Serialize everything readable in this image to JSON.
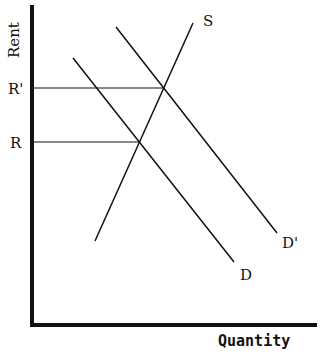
{
  "diagram": {
    "type": "supply-demand",
    "title": "",
    "axes": {
      "y_label": "Rent",
      "x_label": "Quantity"
    },
    "price_levels": [
      {
        "label": "R'",
        "y": 88
      },
      {
        "label": "R",
        "y": 142
      }
    ],
    "curves": [
      {
        "name": "S",
        "label": "S",
        "x1": 95,
        "y1": 241,
        "x2": 193,
        "y2": 23
      },
      {
        "name": "D",
        "label": "D",
        "x1": 73,
        "y1": 58,
        "x2": 234,
        "y2": 262
      },
      {
        "name": "D-prime",
        "label": "D'",
        "x1": 116,
        "y1": 27,
        "x2": 277,
        "y2": 233
      }
    ],
    "equilibria": [
      {
        "price": "R'",
        "x": 164,
        "y": 88
      },
      {
        "price": "R",
        "x": 139,
        "y": 142
      }
    ],
    "colors": {
      "ink": "#111111",
      "background": "#ffffff"
    }
  }
}
